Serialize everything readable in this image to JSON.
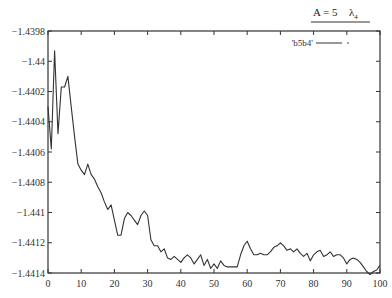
{
  "chart_data": {
    "type": "line",
    "title": "A = 5   λ4",
    "title_main": "A = 5",
    "title_symbol": "λ",
    "title_sub": "4",
    "xlabel": "",
    "ylabel": "",
    "xlim": [
      0,
      100
    ],
    "ylim": [
      -1.4414,
      -1.4398
    ],
    "x_ticks": [
      0,
      10,
      20,
      30,
      40,
      50,
      60,
      70,
      80,
      90,
      100
    ],
    "x_tick_labels": [
      "0",
      "10",
      "20",
      "30",
      "40",
      "50",
      "60",
      "70",
      "80",
      "90",
      "100"
    ],
    "y_ticks": [
      -1.4398,
      -1.44,
      -1.4402,
      -1.4404,
      -1.4406,
      -1.4408,
      -1.441,
      -1.4412,
      -1.4414
    ],
    "y_tick_labels": [
      "-1.4398",
      "-1.44",
      "-1.4402",
      "-1.4404",
      "-1.4406",
      "-1.4408",
      "-1.441",
      "-1.4412",
      "-1.4414"
    ],
    "grid": false,
    "legend_position": "upper right",
    "series": [
      {
        "name": "'b5b4'",
        "color": "#333333",
        "x": [
          0,
          1,
          2,
          3,
          4,
          5,
          6,
          7,
          8,
          9,
          10,
          11,
          12,
          13,
          14,
          15,
          16,
          17,
          18,
          19,
          20,
          21,
          22,
          23,
          24,
          25,
          26,
          27,
          28,
          29,
          30,
          31,
          32,
          33,
          34,
          35,
          36,
          37,
          38,
          39,
          40,
          41,
          42,
          43,
          44,
          45,
          46,
          47,
          48,
          49,
          50,
          51,
          52,
          53,
          54,
          55,
          56,
          57,
          58,
          59,
          60,
          61,
          62,
          63,
          64,
          65,
          66,
          67,
          68,
          69,
          70,
          71,
          72,
          73,
          74,
          75,
          76,
          77,
          78,
          79,
          80,
          81,
          82,
          83,
          84,
          85,
          86,
          87,
          88,
          89,
          90,
          91,
          92,
          93,
          94,
          95,
          96,
          97,
          98,
          99,
          100
        ],
        "values": [
          -1.4403,
          -1.44058,
          -1.43993,
          -1.44048,
          -1.44017,
          -1.44017,
          -1.4401,
          -1.4403,
          -1.4405,
          -1.44068,
          -1.44072,
          -1.44075,
          -1.44068,
          -1.44075,
          -1.44078,
          -1.44083,
          -1.44087,
          -1.44093,
          -1.44098,
          -1.44095,
          -1.44105,
          -1.44115,
          -1.44115,
          -1.44104,
          -1.441,
          -1.44102,
          -1.44105,
          -1.44108,
          -1.44102,
          -1.44099,
          -1.44102,
          -1.44118,
          -1.44122,
          -1.44122,
          -1.44126,
          -1.44124,
          -1.4413,
          -1.44131,
          -1.44129,
          -1.44131,
          -1.44133,
          -1.4413,
          -1.44128,
          -1.4413,
          -1.44134,
          -1.44131,
          -1.44128,
          -1.44135,
          -1.44131,
          -1.44137,
          -1.44134,
          -1.44137,
          -1.44132,
          -1.44135,
          -1.44136,
          -1.44136,
          -1.44136,
          -1.44136,
          -1.44128,
          -1.44122,
          -1.44119,
          -1.44124,
          -1.44128,
          -1.44128,
          -1.44127,
          -1.44128,
          -1.44128,
          -1.44126,
          -1.44123,
          -1.44122,
          -1.4412,
          -1.44122,
          -1.44125,
          -1.44124,
          -1.44126,
          -1.44124,
          -1.44127,
          -1.44129,
          -1.44127,
          -1.44132,
          -1.44128,
          -1.44126,
          -1.44125,
          -1.44129,
          -1.44128,
          -1.44126,
          -1.44129,
          -1.44128,
          -1.44128,
          -1.4413,
          -1.44134,
          -1.44131,
          -1.4413,
          -1.44131,
          -1.44133,
          -1.44136,
          -1.44139,
          -1.44141,
          -1.44139,
          -1.44138,
          -1.44135
        ]
      }
    ]
  },
  "layout": {
    "plot_left": 48,
    "plot_right": 380,
    "plot_top": 31,
    "plot_bottom": 273
  }
}
